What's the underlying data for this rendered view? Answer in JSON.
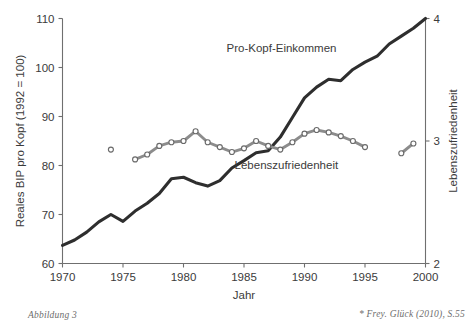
{
  "figure": {
    "caption_left": "Abbildung 3",
    "caption_right": "* Frey. Glück (2010), S.55"
  },
  "chart_data": {
    "type": "line",
    "title": "",
    "xlabel": "Jahr",
    "grid": false,
    "legend_position": "inline-annotations",
    "x": [
      1970,
      1971,
      1972,
      1973,
      1974,
      1975,
      1976,
      1977,
      1978,
      1979,
      1980,
      1981,
      1982,
      1983,
      1984,
      1985,
      1986,
      1987,
      1988,
      1989,
      1990,
      1991,
      1992,
      1993,
      1994,
      1995,
      1996,
      1997,
      1998,
      1999,
      2000
    ],
    "xlim": [
      1970,
      2000
    ],
    "xticks": [
      1970,
      1975,
      1980,
      1985,
      1990,
      1995,
      2000
    ],
    "xtick_labels": [
      "1970",
      "1975",
      "1980",
      "1985",
      "1990",
      "1995",
      "2000"
    ],
    "axes": {
      "left": {
        "label": "Reales BIP pro Kopf (1992 = 100)",
        "ylim": [
          60,
          110
        ],
        "yticks": [
          60,
          70,
          80,
          90,
          100,
          110
        ],
        "ytick_labels": [
          "60",
          "70",
          "80",
          "90",
          "100",
          "110"
        ]
      },
      "right": {
        "label": "Lebenszufriedenheit",
        "ylim": [
          2,
          4
        ],
        "yticks": [
          2,
          3,
          4
        ],
        "ytick_labels": [
          "2",
          "3",
          "4"
        ]
      }
    },
    "series": [
      {
        "name": "Pro-Kopf-Einkommen",
        "axis": "left",
        "style": "thick-dark-line",
        "color": "#2e2e2e",
        "label_position": {
          "x": 1988.1,
          "y": 103.2
        },
        "x": [
          1970,
          1971,
          1972,
          1973,
          1974,
          1975,
          1976,
          1977,
          1978,
          1979,
          1980,
          1981,
          1982,
          1983,
          1984,
          1985,
          1986,
          1987,
          1988,
          1989,
          1990,
          1991,
          1992,
          1993,
          1994,
          1995,
          1996,
          1997,
          1998,
          1999,
          2000
        ],
        "values": [
          63.7,
          64.8,
          66.4,
          68.5,
          70.0,
          68.6,
          70.7,
          72.3,
          74.3,
          77.3,
          77.6,
          76.5,
          75.8,
          76.9,
          79.5,
          81.0,
          82.6,
          83.0,
          85.8,
          89.8,
          93.8,
          96.0,
          97.6,
          97.3,
          99.6,
          101.1,
          102.3,
          104.8,
          106.4,
          108.0,
          110.0
        ]
      },
      {
        "name": "Lebenszufriedenheit",
        "axis": "right",
        "style": "grey-line-with-open-circle-markers",
        "color": "#8c8c8c",
        "label_position": {
          "x": 1988.5,
          "y": 2.77
        },
        "segments": [
          {
            "x": [
              1974
            ],
            "values": [
              2.93
            ]
          },
          {
            "x": [
              1976,
              1977,
              1978,
              1979,
              1980,
              1981,
              1982,
              1983,
              1984,
              1985,
              1986,
              1987,
              1988,
              1989,
              1990,
              1991,
              1992,
              1993,
              1994,
              1995
            ],
            "values": [
              2.85,
              2.89,
              2.96,
              2.99,
              3.0,
              3.08,
              2.99,
              2.95,
              2.91,
              2.94,
              3.0,
              2.96,
              2.93,
              2.99,
              3.06,
              3.09,
              3.07,
              3.04,
              3.0,
              2.95
            ]
          },
          {
            "x": [
              1998,
              1999
            ],
            "values": [
              2.9,
              2.98
            ]
          }
        ]
      }
    ]
  }
}
